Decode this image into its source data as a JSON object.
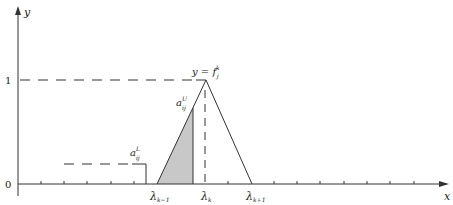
{
  "axes": {
    "x_label": "x",
    "y_label": "y",
    "origin_label": "0",
    "y_one_label": "1"
  },
  "labels": {
    "peak": "y = f",
    "peak_sup": "k",
    "peak_sub": "j",
    "a_upper_base": "a",
    "a_upper_sup": "U",
    "a_upper_sub": "ij",
    "a_lower_base": "a",
    "a_lower_sup": "L",
    "a_lower_sub": "ij",
    "lambda_km1_base": "λ",
    "lambda_km1_sub": "k−1",
    "lambda_k_base": "λ",
    "lambda_k_sub": "k",
    "lambda_kp1_base": "λ",
    "lambda_kp1_sub": "k+1"
  },
  "colors": {
    "line": "#333333",
    "shade": "#c8c8c8",
    "background": "#ffffff"
  }
}
